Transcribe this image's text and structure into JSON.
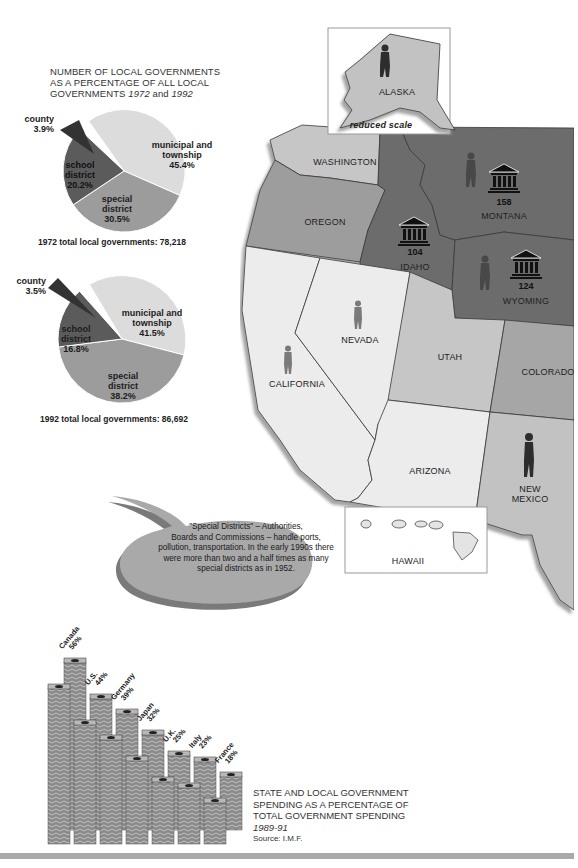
{
  "pie_section": {
    "title_line1": "NUMBER OF LOCAL GOVERNMENTS",
    "title_line2": "AS A PERCENTAGE OF ALL LOCAL",
    "title_line3_prefix": "GOVERNMENTS ",
    "title_year1": "1972",
    "title_and": " and ",
    "title_year2": "1992"
  },
  "chart_data": [
    {
      "type": "pie",
      "title": "Number of local governments as a percentage of all local governments 1972",
      "categories": [
        "municipal and township",
        "special district",
        "school district",
        "county"
      ],
      "values": [
        45.4,
        30.5,
        20.2,
        3.9
      ],
      "labels": {
        "municipal_1": "municipal and",
        "municipal_2": "township",
        "municipal_pct": "45.4%",
        "special_1": "special",
        "special_2": "district",
        "special_pct": "30.5%",
        "school_1": "school",
        "school_2": "district",
        "school_pct": "20.2%",
        "county_1": "county",
        "county_pct": "3.9%"
      },
      "total_label": "1972 total local governments: 78,218",
      "colors": [
        "#dcdcdc",
        "#9a9a9a",
        "#5a5a5a",
        "#3a3a3a"
      ]
    },
    {
      "type": "pie",
      "title": "Number of local governments as a percentage of all local governments 1992",
      "categories": [
        "municipal and township",
        "special district",
        "school district",
        "county"
      ],
      "values": [
        41.5,
        38.2,
        16.8,
        3.5
      ],
      "labels": {
        "municipal_1": "municipal and",
        "municipal_2": "township",
        "municipal_pct": "41.5%",
        "special_1": "special",
        "special_2": "district",
        "special_pct": "38.2%",
        "school_1": "school",
        "school_2": "district",
        "school_pct": "16.8%",
        "county_1": "county",
        "county_pct": "3.5%"
      },
      "total_label": "1992 total local governments: 86,692",
      "colors": [
        "#dcdcdc",
        "#9a9a9a",
        "#5a5a5a",
        "#3a3a3a"
      ]
    },
    {
      "type": "bar",
      "title": "STATE AND LOCAL GOVERNMENT SPENDING AS A PERCENTAGE OF TOTAL GOVERNMENT SPENDING 1989-91",
      "source": "Source: I.M.F.",
      "categories": [
        "Canada",
        "U.S.",
        "Germany",
        "Japan",
        "U.K.",
        "Italy",
        "France"
      ],
      "values": [
        56,
        44,
        39,
        32,
        25,
        23,
        18
      ],
      "value_labels": [
        "56%",
        "44%",
        "39%",
        "32%",
        "25%",
        "23%",
        "18%"
      ],
      "xlabel": "",
      "ylabel": "",
      "grid": false,
      "legend": "none",
      "style": "stacked banknote columns"
    }
  ],
  "map": {
    "inset_alaska": {
      "label": "ALASKA",
      "note": "reduced scale"
    },
    "inset_hawaii": {
      "label": "HAWAII"
    },
    "states": [
      {
        "name": "WASHINGTON"
      },
      {
        "name": "OREGON"
      },
      {
        "name": "IDAHO",
        "count": "104"
      },
      {
        "name": "MONTANA",
        "count": "158"
      },
      {
        "name": "WYOMING",
        "count": "124"
      },
      {
        "name": "NEVADA"
      },
      {
        "name": "CALIFORNIA"
      },
      {
        "name": "UTAH"
      },
      {
        "name": "COLORADO"
      },
      {
        "name": "ARIZONA"
      },
      {
        "name": "NEW",
        "name2": "MEXICO"
      }
    ],
    "colors": {
      "light": "#ececec",
      "mid_light": "#c4c4c4",
      "mid": "#9d9d9d",
      "dark": "#6b6b6b",
      "line": "#3a3a3a"
    }
  },
  "callout": {
    "line1": "\"Special Districts\" – Authorities,",
    "line2": "Boards and Commissions – handle ports,",
    "line3": "pollution, transportation. In the early 1990s there",
    "line4": "were more than two and a half times as many",
    "line5": "special districts as in 1952."
  },
  "spending": {
    "title1": "STATE AND LOCAL GOVERNMENT",
    "title2": "SPENDING AS A PERCENTAGE OF",
    "title3": "TOTAL GOVERNMENT SPENDING",
    "years": "1989-91",
    "source": "Source: I.M.F."
  }
}
